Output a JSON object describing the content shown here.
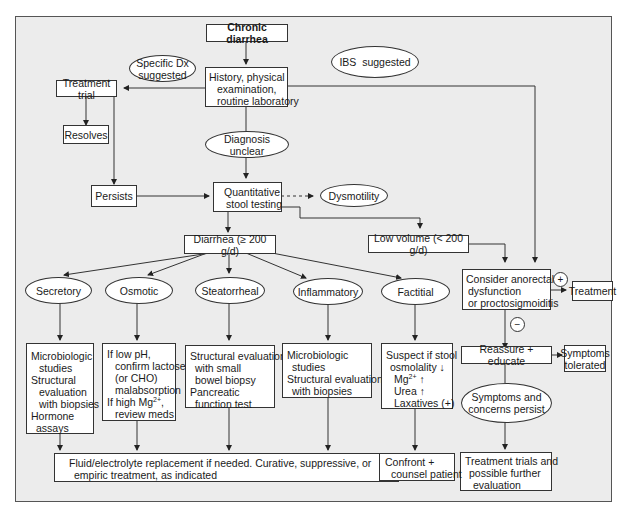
{
  "title": "Chronic diarrhea",
  "colors": {
    "background": "#ececec",
    "box": "#ffffff",
    "line": "#333333"
  },
  "nodes": {
    "start": "Chronic diarrhea",
    "specific_dx": [
      "Specific Dx",
      "suggested"
    ],
    "ibs": "IBS  suggested",
    "history": [
      "History, physical",
      "examination,",
      "routine laboratory"
    ],
    "treatment_trial": "Treatment trial",
    "resolves": "Resolves",
    "diagnosis_unclear": "Diagnosis unclear",
    "persists": "Persists",
    "quantitative": [
      "Quantitative",
      "stool testing"
    ],
    "dysmotility": "Dysmotility",
    "diarrhea": "Diarrhea (≥ 200 g/d)",
    "low_volume": "Low volume (< 200 g/d)",
    "anorectal": [
      "Consider anorectal",
      "dysfunction",
      "or proctosigmoiditis"
    ],
    "treatment": "Treatment",
    "plus": "+",
    "minus": "−",
    "reassure": "Reassure + educate",
    "symptoms_tolerated": [
      "Symptoms",
      "tolerated"
    ],
    "symptoms_persist": [
      "Symptoms and",
      "concerns persist"
    ],
    "treatment_trials": [
      "Treatment trials and",
      "possible further",
      "evaluation"
    ],
    "categories": [
      "Secretory",
      "Osmotic",
      "Steatorrheal",
      "Inflammatory",
      "Factitial"
    ],
    "secretory_eval": [
      "Microbiologic",
      "studies",
      "Structural",
      "evaluation",
      "with biopsies",
      "Hormone",
      "assays"
    ],
    "osmotic_eval": [
      "If low pH,",
      "confirm lactose",
      "(or CHO)",
      "malabsorption",
      "If high Mg",
      "2+",
      ",",
      "review meds"
    ],
    "steatorrheal_eval": [
      "Structural evaluation",
      "with small",
      "bowel biopsy",
      "Pancreatic",
      "function test"
    ],
    "inflammatory_eval": [
      "Microbiologic",
      "studies",
      "Structural evaluation",
      "with biopsies"
    ],
    "factitial_eval": [
      "Suspect if stool",
      "osmolality ↓",
      "Mg",
      "2+",
      " ↑",
      "Urea ↑",
      "Laxatives (+)"
    ],
    "fluid": [
      "Fluid/electrolyte replacement if needed. Curative, suppressive, or",
      "empiric treatment, as indicated"
    ],
    "confront": [
      "Confront +",
      "counsel patient"
    ]
  }
}
